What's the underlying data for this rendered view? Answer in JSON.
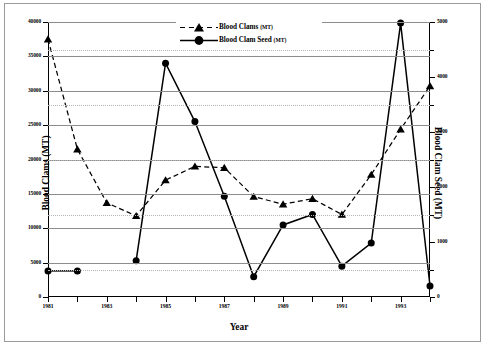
{
  "chart_data": {
    "type": "line",
    "title": "",
    "xlabel": "Year",
    "ylabel": "Blood Clams (MT)",
    "ylabel_right": "Blood Clam Seed (MT)",
    "grid": true,
    "legend_position": "top-right",
    "x": [
      1981,
      1982,
      1983,
      1984,
      1985,
      1986,
      1987,
      1988,
      1989,
      1990,
      1991,
      1992,
      1993,
      1994
    ],
    "xlim": [
      1981,
      1994
    ],
    "xticks": [
      1981,
      1982,
      1983,
      1984,
      1985,
      1986,
      1987,
      1988,
      1989,
      1990,
      1991,
      1992,
      1993,
      1994
    ],
    "xticklabels": [
      "1981",
      "",
      "1983",
      "",
      "1985",
      "",
      "1987",
      "",
      "1989",
      "",
      "1991",
      "",
      "1993",
      ""
    ],
    "ylim": [
      0,
      40000
    ],
    "yticks": [
      0,
      5000,
      10000,
      15000,
      20000,
      25000,
      30000,
      35000,
      40000
    ],
    "yticklabels": [
      "0",
      "5000",
      "10000",
      "15000",
      "20000",
      "25000",
      "30000",
      "35000",
      "40000"
    ],
    "ylim_right": [
      0,
      5000
    ],
    "yticks_right": [
      0,
      1000,
      2000,
      3000,
      4000,
      5000
    ],
    "yticklabels_right": [
      "0",
      "1000",
      "2000",
      "3000",
      "4000",
      "5000"
    ],
    "yminor_right": [
      500,
      1500,
      2500,
      3500,
      4500
    ],
    "series": [
      {
        "name": "Blood Clams",
        "unit": "MT",
        "legend_label": "Blood Clams",
        "axis": "left",
        "line_style": "dashed",
        "marker": "triangle",
        "color": "#000000",
        "values": [
          37500,
          21500,
          13700,
          11800,
          17000,
          19000,
          18800,
          14600,
          13500,
          14300,
          12000,
          17800,
          24400,
          30700
        ]
      },
      {
        "name": "Blood Clam Seed",
        "unit": "MT",
        "legend_label": "Blood Clam Seed",
        "axis": "right",
        "line_style": "solid",
        "marker": "circle",
        "color": "#000000",
        "values": [
          475,
          475,
          null,
          660,
          4250,
          3190,
          1830,
          370,
          1310,
          1500,
          560,
          980,
          4980,
          200
        ]
      }
    ],
    "series_right_as_left_equivalent": {
      "Blood Clam Seed": [
        3800,
        3800,
        null,
        5300,
        34000,
        25500,
        14650,
        2950,
        10500,
        12000,
        4500,
        7850,
        39800,
        1600
      ]
    }
  },
  "legend": {
    "entries": [
      {
        "label": "Blood Clams",
        "unit": "(MT)",
        "marker": "triangle",
        "line": "dashed"
      },
      {
        "label": "Blood Clam Seed",
        "unit": "(MT)",
        "marker": "circle",
        "line": "solid"
      }
    ]
  }
}
